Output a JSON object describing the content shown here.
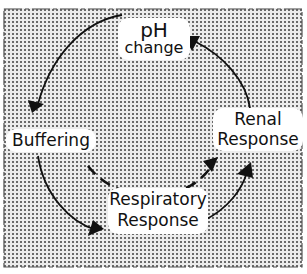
{
  "diagram": {
    "background": {
      "fill_pattern": "stippled-dots",
      "border_style": "dashed",
      "dot_color": "#6a6a6a"
    },
    "nodes": {
      "ph_change": {
        "line1": "pH",
        "line2": "change"
      },
      "buffering": {
        "label": "Buffering"
      },
      "renal": {
        "line1": "Renal",
        "line2": "Response"
      },
      "respiratory": {
        "line1": "Respiratory",
        "line2": "Response"
      }
    },
    "edges": [
      {
        "from": "pH change",
        "to": "Buffering",
        "style": "solid"
      },
      {
        "from": "Buffering",
        "to": "Respiratory Response",
        "style": "solid"
      },
      {
        "from": "Respiratory Response",
        "to": "Renal Response",
        "style": "solid"
      },
      {
        "from": "Renal Response",
        "to": "pH change",
        "style": "solid"
      },
      {
        "from": "Buffering",
        "to": "Renal Response",
        "style": "dashed"
      }
    ],
    "colors": {
      "ink": "#111111",
      "label_bg": "#ffffff"
    }
  }
}
